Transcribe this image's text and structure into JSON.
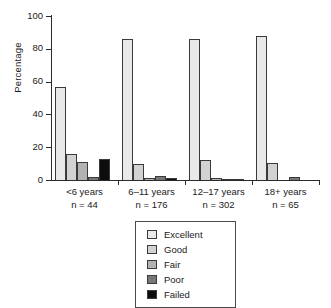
{
  "chart_data": {
    "type": "bar",
    "title": "",
    "xlabel": "",
    "ylabel": "Percentage",
    "ylim": [
      0,
      100
    ],
    "yticks": [
      0,
      20,
      40,
      60,
      80,
      100
    ],
    "grid": false,
    "legend_position": "below-axis-center",
    "categories": [
      "<6 years",
      "6–11 years",
      "12–17 years",
      "18+ years"
    ],
    "category_sublabels": [
      "n = 44",
      "n = 176",
      "n = 302",
      "n = 65"
    ],
    "series": [
      {
        "name": "Excellent",
        "color": "#e9e9e9",
        "values": [
          57,
          86,
          86,
          88
        ]
      },
      {
        "name": "Good",
        "color": "#d2d2d2",
        "values": [
          16,
          10,
          12,
          10.5
        ]
      },
      {
        "name": "Fair",
        "color": "#b2b2b2",
        "values": [
          11,
          1,
          1,
          0
        ]
      },
      {
        "name": "Poor",
        "color": "#777777",
        "values": [
          2,
          2.5,
          0.5,
          2
        ]
      },
      {
        "name": "Failed",
        "color": "#0d0d0d",
        "values": [
          13,
          1.5,
          0.3,
          0
        ]
      }
    ]
  },
  "axis": {
    "ytick_labels": [
      "0",
      "20",
      "40",
      "60",
      "80",
      "100"
    ]
  },
  "legend": {
    "items": [
      {
        "label": "Excellent",
        "color": "#e9e9e9"
      },
      {
        "label": "Good",
        "color": "#d2d2d2"
      },
      {
        "label": "Fair",
        "color": "#b2b2b2"
      },
      {
        "label": "Poor",
        "color": "#777777"
      },
      {
        "label": "Failed",
        "color": "#0d0d0d"
      }
    ]
  }
}
